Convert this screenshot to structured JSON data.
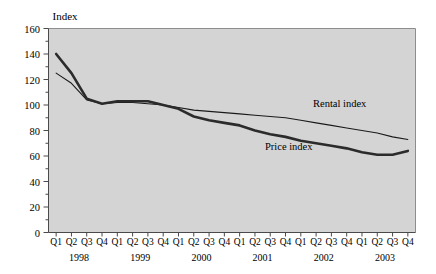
{
  "chart_data": {
    "type": "line",
    "title": "",
    "ylabel": "Index",
    "xlabel": "",
    "ylim": [
      0,
      160
    ],
    "ytick_values": [
      0,
      20,
      40,
      60,
      80,
      100,
      120,
      140,
      160
    ],
    "ytick_labels": [
      "0",
      "20",
      "40",
      "60",
      "80",
      "100",
      "120",
      "140",
      "160"
    ],
    "yminor_step": 10,
    "grid": false,
    "legend_position": "inline-annotations",
    "categories": [
      "Q1",
      "Q2",
      "Q3",
      "Q4",
      "Q1",
      "Q2",
      "Q3",
      "Q4",
      "Q1",
      "Q2",
      "Q3",
      "Q4",
      "Q1",
      "Q2",
      "Q3",
      "Q4",
      "Q1",
      "Q2",
      "Q3",
      "Q4",
      "Q1",
      "Q2",
      "Q3",
      "Q4"
    ],
    "year_groups": [
      {
        "label": "1998",
        "start_index": 0,
        "end_index": 3
      },
      {
        "label": "1999",
        "start_index": 4,
        "end_index": 7
      },
      {
        "label": "2000",
        "start_index": 8,
        "end_index": 11
      },
      {
        "label": "2001",
        "start_index": 12,
        "end_index": 15
      },
      {
        "label": "2002",
        "start_index": 16,
        "end_index": 19
      },
      {
        "label": "2003",
        "start_index": 20,
        "end_index": 23
      }
    ],
    "series": [
      {
        "name": "Rental index",
        "style": "thin",
        "color": "#1a1a1a",
        "values": [
          125,
          117,
          104,
          101,
          102,
          102,
          101,
          100,
          98,
          96,
          95,
          94,
          93,
          92,
          91,
          90,
          88,
          86,
          84,
          82,
          80,
          78,
          75,
          73
        ]
      },
      {
        "name": "Price index",
        "style": "thick",
        "color": "#2b2b2b",
        "values": [
          140,
          125,
          105,
          101,
          103,
          103,
          103,
          100,
          97,
          91,
          88,
          86,
          84,
          80,
          77,
          75,
          72,
          70,
          68,
          66,
          63,
          61,
          61,
          64
        ]
      }
    ],
    "annotations": [
      {
        "text": "Rental index",
        "series": "Rental index"
      },
      {
        "text": "Price index",
        "series": "Price index"
      }
    ],
    "colors": {
      "plot_background": "#d4d4d4",
      "axis": "#3a3a3a",
      "text": "#000000",
      "page_background": "#ffffff"
    }
  }
}
